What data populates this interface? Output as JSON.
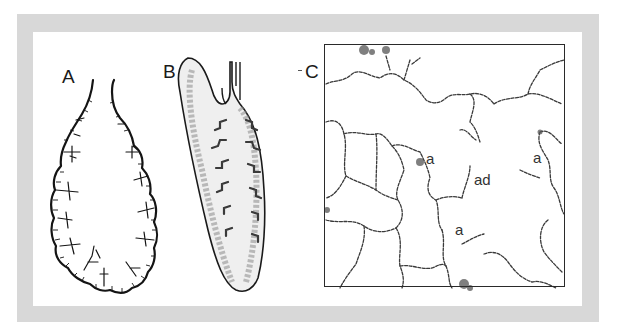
{
  "figure": {
    "panels": [
      {
        "id": "A",
        "label": "A",
        "description": "Lobule outline with branching septa"
      },
      {
        "id": "B",
        "label": "B",
        "description": "Sectioned lobule with airway branches"
      },
      {
        "id": "C",
        "label": "C",
        "description": "Alveolar tissue section"
      }
    ],
    "panel_c_labels": [
      {
        "text": "a",
        "role": "alveolus"
      },
      {
        "text": "ad",
        "role": "alveolar duct"
      },
      {
        "text": "a",
        "role": "alveolus"
      },
      {
        "text": "a",
        "role": "alveolus"
      }
    ],
    "colors": {
      "frame": "#d8d8d8",
      "ink": "#1a1a1a",
      "tissue_fill": "#bdbdbd",
      "background": "#ffffff"
    }
  }
}
